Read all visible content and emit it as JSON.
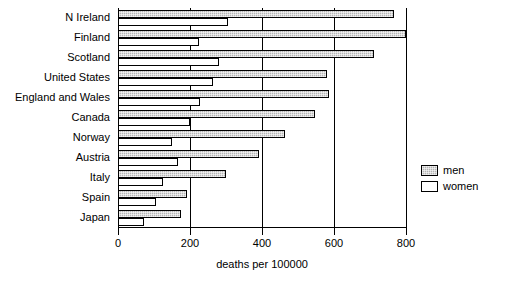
{
  "chart_data": {
    "type": "bar",
    "orientation": "horizontal",
    "title": "",
    "xlabel": "deaths per 100000",
    "ylabel": "",
    "xlim": [
      0,
      800
    ],
    "xticks": [
      0,
      200,
      400,
      600,
      800
    ],
    "xticklabels": [
      "0",
      "200",
      "400",
      "600",
      "800"
    ],
    "grid": true,
    "grid_axis": "x",
    "legend_position": "right",
    "categories": [
      "N Ireland",
      "Finland",
      "Scotland",
      "United States",
      "England and Wales",
      "Canada",
      "Norway",
      "Austria",
      "Italy",
      "Spain",
      "Japan"
    ],
    "series": [
      {
        "name": "men",
        "color": "#b4b4b4",
        "pattern": "stippled-gray",
        "values": [
          768,
          800,
          710,
          580,
          585,
          548,
          465,
          393,
          300,
          193,
          176
        ]
      },
      {
        "name": "women",
        "color": "#ffffff",
        "pattern": "solid-white",
        "values": [
          305,
          226,
          281,
          263,
          228,
          201,
          150,
          168,
          124,
          105,
          72
        ]
      }
    ]
  },
  "legend": {
    "entries": [
      {
        "label": "men",
        "swatch": "men"
      },
      {
        "label": "women",
        "swatch": "women"
      }
    ]
  },
  "axis": {
    "x_title": "deaths per 100000"
  }
}
